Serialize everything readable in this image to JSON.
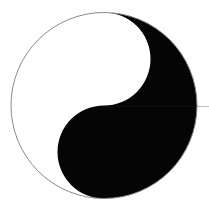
{
  "image": {
    "title": "Taijitu (Yin-Yang Symbol)",
    "subject": "yin-yang-symbol",
    "width": 209,
    "height": 210,
    "background_color": "#ffffff"
  },
  "symbol": {
    "name": "taijitu",
    "center_x": 104,
    "center_y": 105.5,
    "radius": 93,
    "outline_color": "#8a8a8a",
    "outline_width": 1,
    "yang_color": "#ffffff",
    "yin_color": "#050505",
    "has_eye_dots": false,
    "orientation": "yang-upper-left-yin-lower-right",
    "yin_head": {
      "label": "yin-lobe-upper-right",
      "center_x": 150.5,
      "center_y": 105.5,
      "radius": 46.5,
      "color": "#050505"
    },
    "yang_head": {
      "label": "yang-lobe-lower-left",
      "center_x": 57.5,
      "center_y": 105.5,
      "radius": 46.5,
      "color": "#ffffff"
    }
  },
  "artifacts": {
    "scanline_label": "faint-horizontal-seam",
    "scanline_y": 106,
    "scanline_color": "#282828"
  }
}
